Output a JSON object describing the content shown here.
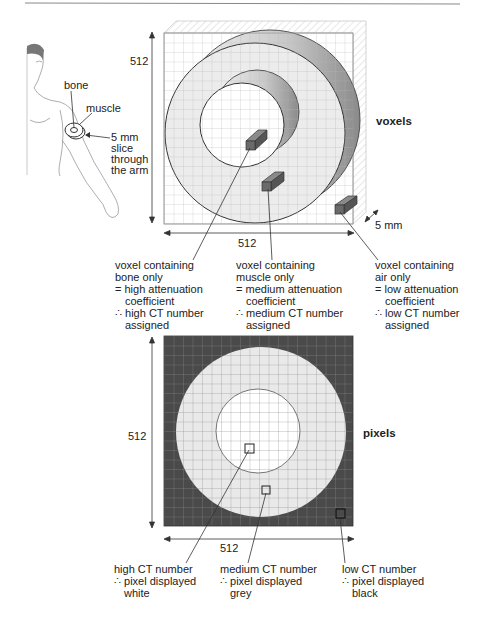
{
  "figure": {
    "human": {
      "bone_label": "bone",
      "muscle_label": "muscle",
      "slice_label": [
        "5 mm",
        "slice",
        "through",
        "the arm"
      ]
    },
    "voxels": {
      "title": "voxels",
      "height_label": "512",
      "width_label": "512",
      "depth_label": "5 mm",
      "annotations": [
        {
          "lines": [
            "voxel containing",
            "bone only",
            "= high attenuation",
            "coefficient",
            "∴ high CT number",
            "assigned"
          ]
        },
        {
          "lines": [
            "voxel containing",
            "muscle only",
            "= medium attenuation",
            "coefficient",
            "∴ medium CT number",
            "assigned"
          ]
        },
        {
          "lines": [
            "voxel containing",
            "air only",
            "= low attenuation",
            "coefficient",
            "∴ low CT number",
            "assigned"
          ]
        }
      ]
    },
    "pixels": {
      "title": "pixels",
      "height_label": "512",
      "width_label": "512",
      "annotations": [
        {
          "lines": [
            "high CT number",
            "∴ pixel displayed",
            "white"
          ]
        },
        {
          "lines": [
            "medium CT number",
            "∴ pixel displayed",
            "grey"
          ]
        },
        {
          "lines": [
            "low CT number",
            "∴ pixel displayed",
            "black"
          ]
        }
      ]
    },
    "colors": {
      "grid_line": "#9a9a9a",
      "dark_bg": "#4a4a4a",
      "grey_ring": "#e6e6e6",
      "white_center": "#ffffff",
      "voxel_block": "#6e6e6e"
    }
  }
}
